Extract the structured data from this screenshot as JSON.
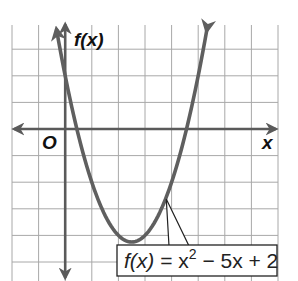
{
  "chart_data": {
    "type": "line",
    "title": "",
    "function": "f(x) = x^2 - 5x + 2",
    "coefficients": {
      "a": 1,
      "b": -5,
      "c": 2
    },
    "vertex": [
      2.5,
      -4.25
    ],
    "y_intercept": 2,
    "x_intercepts": [
      0.44,
      4.56
    ],
    "xlabel": "x",
    "ylabel": "f(x)",
    "origin_label": "O",
    "xlim": [
      -2,
      8
    ],
    "ylim": [
      -5.8,
      4
    ],
    "grid": true,
    "grid_step": 1,
    "tick_labels": false,
    "annotation": {
      "text_fx": "f(x)",
      "text_eq": " = x",
      "exponent": "2",
      "text_rest": " − 5x + 2",
      "points_to_x": 3.8
    },
    "colors": {
      "curve": "#5f5f5f",
      "axis": "#5a5a5a",
      "grid": "#a8a8a8"
    }
  }
}
